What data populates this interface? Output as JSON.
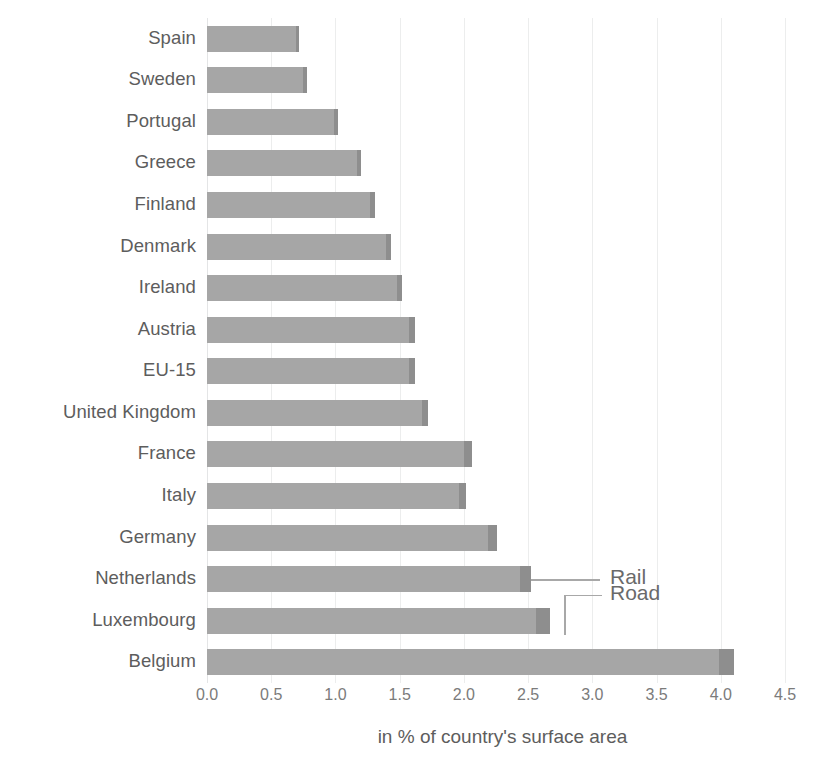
{
  "chart_data": {
    "type": "bar",
    "orientation": "horizontal",
    "stacked": true,
    "title": "",
    "xlabel": "in % of country's surface area",
    "ylabel": "",
    "xlim": [
      0,
      4.5
    ],
    "xticks": [
      "0.0",
      "0.5",
      "1.0",
      "1.5",
      "2.0",
      "2.5",
      "3.0",
      "3.5",
      "4.0",
      "4.5"
    ],
    "xtick_values": [
      0,
      0.5,
      1.0,
      1.5,
      2.0,
      2.5,
      3.0,
      3.5,
      4.0,
      4.5
    ],
    "grid": true,
    "legend_position": "annotated-callouts",
    "categories": [
      "Spain",
      "Sweden",
      "Portugal",
      "Greece",
      "Finland",
      "Denmark",
      "Ireland",
      "Austria",
      "EU-15",
      "United Kingdom",
      "France",
      "Italy",
      "Germany",
      "Netherlands",
      "Luxembourg",
      "Belgium"
    ],
    "series": [
      {
        "name": "Road",
        "color": "#a6a6a6",
        "values": [
          0.69,
          0.75,
          0.99,
          1.17,
          1.27,
          1.39,
          1.48,
          1.57,
          1.57,
          1.67,
          2.0,
          1.96,
          2.19,
          2.44,
          2.56,
          3.99
        ]
      },
      {
        "name": "Rail",
        "color": "#8e8e8e",
        "values": [
          0.03,
          0.03,
          0.03,
          0.03,
          0.04,
          0.04,
          0.04,
          0.05,
          0.05,
          0.05,
          0.06,
          0.06,
          0.07,
          0.08,
          0.11,
          0.11
        ]
      }
    ],
    "totals": [
      0.72,
      0.78,
      1.02,
      1.2,
      1.31,
      1.43,
      1.52,
      1.62,
      1.62,
      1.72,
      2.06,
      2.02,
      2.26,
      2.52,
      2.67,
      4.1
    ],
    "annotations": [
      {
        "label": "Rail",
        "points_to_category": "Netherlands",
        "points_to_series": "Rail"
      },
      {
        "label": "Road",
        "points_to_category": "Luxembourg",
        "points_to_series": "Road"
      }
    ]
  },
  "colors": {
    "road": "#a6a6a6",
    "rail": "#8e8e8e",
    "gridline": "#eceded",
    "label_text": "#5d5d5d",
    "tick_text": "#7b7b7b",
    "annotation_text": "#6a6a6a",
    "background": "#ffffff"
  }
}
